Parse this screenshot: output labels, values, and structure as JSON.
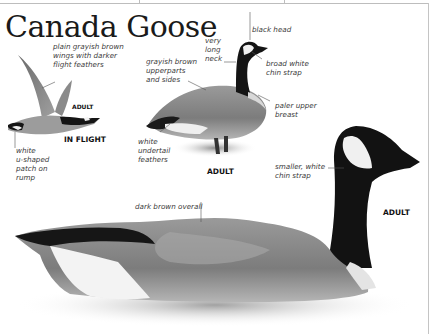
{
  "title": "Canada Goose",
  "captions": {
    "in_flight_adult": "ADULT",
    "in_flight": "IN FLIGHT",
    "standing_adult": "ADULT",
    "swimming_adult": "ADULT"
  },
  "labels": {
    "flight_wings": "plain grayish brown\nwings with darker\nflight feathers",
    "flight_rump": "white\nu-shaped\npatch on\nrump",
    "black_head": "black head",
    "long_neck": "very\nlong\nneck",
    "upperparts": "grayish brown\nupperparts\nand sides",
    "chin_strap_broad": "broad white\nchin strap",
    "paler_breast": "paler upper\nbreast",
    "undertail": "white\nundertail\nfeathers",
    "chin_strap_smaller": "smaller, white\nchin strap",
    "dark_brown": "dark brown overall"
  },
  "colors": {
    "text": "#1a1a1a",
    "label_text": "#3a3a3a",
    "goose_black": "#141414",
    "goose_body": "#8a8a8a",
    "goose_white": "#f2f2f2",
    "leader_line": "#555555"
  }
}
